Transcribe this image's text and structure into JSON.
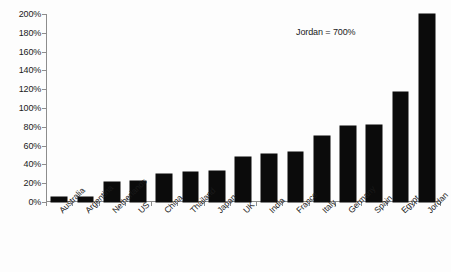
{
  "chart_data": {
    "type": "bar",
    "title": "",
    "subtitle": "",
    "xlabel": "",
    "ylabel": "",
    "ylim": [
      0,
      200
    ],
    "y_tick_step": 20,
    "y_tick_labels": [
      "0%",
      "20%",
      "40%",
      "60%",
      "80%",
      "100%",
      "120%",
      "140%",
      "160%",
      "180%",
      "200%"
    ],
    "y_tick_values": [
      0,
      20,
      40,
      60,
      80,
      100,
      120,
      140,
      160,
      180,
      200
    ],
    "grid": false,
    "legend": false,
    "legend_position": "none",
    "value_format": "percent",
    "categories": [
      "Australia",
      "Argentina",
      "Netherlands",
      "US",
      "China",
      "Thailand",
      "Japan",
      "UK",
      "India",
      "France",
      "Italy",
      "Germany",
      "Spain",
      "Egypt",
      "Jordan"
    ],
    "values": [
      5,
      5,
      21,
      22,
      30,
      32,
      33,
      48,
      51,
      53,
      70,
      81,
      82,
      117,
      200
    ],
    "display_values": [
      "5%",
      "5%",
      "21%",
      "22%",
      "30%",
      "32%",
      "33%",
      "48%",
      "51%",
      "53%",
      "70%",
      "81%",
      "82%",
      "117%",
      "200%"
    ],
    "bar_color": "#0b0b0b",
    "axis_color": "#8d8d8d",
    "background_color": "#fdfdfd",
    "annotations": [
      {
        "text": "Jordan = 700%",
        "note": "Jordan bar is clipped at the 200% axis maximum; true value is 700%"
      }
    ],
    "clipped_bars": [
      {
        "category": "Jordan",
        "plotted_value": 200,
        "true_value": 700
      }
    ]
  },
  "annotation": {
    "text": "Jordan = 700%"
  }
}
